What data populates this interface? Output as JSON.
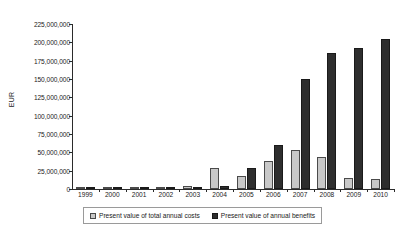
{
  "chart_data": {
    "type": "bar",
    "title": "",
    "xlabel": "",
    "ylabel": "EUR",
    "ylim": [
      0,
      225000000
    ],
    "ytick_step": 25000000,
    "grid": false,
    "legend_position": "bottom",
    "categories": [
      "1999",
      "2000",
      "2001",
      "2002",
      "2003",
      "2004",
      "2005",
      "2006",
      "2007",
      "2008",
      "2009",
      "2010"
    ],
    "ytick_labels": [
      "225,000,000",
      "200,000,000",
      "175,000,000",
      "150,000,000",
      "125,000,000",
      "100,000,000",
      "75,000,000",
      "50,000,000",
      "25,000,000",
      "0"
    ],
    "ytick_values": [
      225000000,
      200000000,
      175000000,
      150000000,
      125000000,
      100000000,
      75000000,
      50000000,
      25000000,
      0
    ],
    "series": [
      {
        "name": "Present value of total annual costs",
        "color": "#c8c8c8",
        "values": [
          2500000,
          3000000,
          3000000,
          3000000,
          4000000,
          28000000,
          18000000,
          38000000,
          53000000,
          44000000,
          15000000,
          13000000
        ]
      },
      {
        "name": "Present value of annual benefits",
        "color": "#2e2e2e",
        "values": [
          500000,
          500000,
          500000,
          500000,
          500000,
          4000000,
          28000000,
          60000000,
          150000000,
          185000000,
          192000000,
          205000000
        ]
      }
    ]
  },
  "legend": {
    "items": [
      {
        "label": "Present value of total annual costs",
        "swatch": "costs"
      },
      {
        "label": "Present value of annual benefits",
        "swatch": "benefits"
      }
    ]
  }
}
